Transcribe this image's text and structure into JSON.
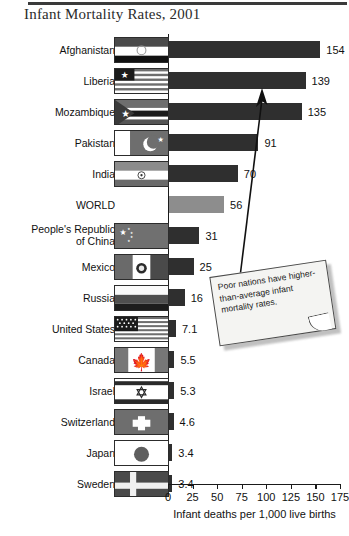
{
  "chart_data": {
    "type": "bar",
    "orientation": "horizontal",
    "title": "Infant Mortality Rates, 2001",
    "xlabel": "Infant deaths per 1,000 live births",
    "ylabel": "",
    "xlim": [
      0,
      175
    ],
    "xticks": [
      0,
      25,
      50,
      75,
      100,
      125,
      150,
      175
    ],
    "grid": false,
    "legend": false,
    "categories": [
      "Afghanistan",
      "Liberia",
      "Mozambique",
      "Pakistan",
      "India",
      "WORLD",
      "People's Republic of China",
      "Mexico",
      "Russia",
      "United States",
      "Canada",
      "Israel",
      "Switzerland",
      "Japan",
      "Sweden"
    ],
    "values": [
      154,
      139,
      135,
      91,
      70,
      56,
      31,
      25,
      16,
      7.1,
      5.5,
      5.3,
      4.6,
      3.4,
      3.4
    ],
    "value_labels": [
      "154",
      "139",
      "135",
      "91",
      "70",
      "56",
      "31",
      "25",
      "16",
      "7.1",
      "5.5",
      "5.3",
      "4.6",
      "3.4",
      "3.4"
    ],
    "highlight_category": "WORLD",
    "colors": {
      "bar": "#2f2f2f",
      "highlight_bar": "#8d8d8d",
      "axis": "#1a1a1a",
      "text": "#111111"
    },
    "annotation": {
      "text": "Poor nations have higher-than-average infant mortality rates.",
      "points_to": "Mozambique"
    }
  },
  "rows": [
    {
      "label": "Afghanistan",
      "label_lines": [
        "Afghanistan"
      ],
      "value": "154",
      "flag": "flag-afghanistan",
      "has_flag": true
    },
    {
      "label": "Liberia",
      "label_lines": [
        "Liberia"
      ],
      "value": "139",
      "flag": "flag-liberia",
      "has_flag": true
    },
    {
      "label": "Mozambique",
      "label_lines": [
        "Mozambique"
      ],
      "value": "135",
      "flag": "flag-mozambique",
      "has_flag": true
    },
    {
      "label": "Pakistan",
      "label_lines": [
        "Pakistan"
      ],
      "value": "91",
      "flag": "flag-pakistan",
      "has_flag": true
    },
    {
      "label": "India",
      "label_lines": [
        "India"
      ],
      "value": "70",
      "flag": "flag-india",
      "has_flag": true
    },
    {
      "label": "WORLD",
      "label_lines": [
        "WORLD"
      ],
      "value": "56",
      "flag": "",
      "has_flag": false
    },
    {
      "label": "People's Republic of China",
      "label_lines": [
        "People's Republic",
        "of China"
      ],
      "value": "31",
      "flag": "flag-china",
      "has_flag": true
    },
    {
      "label": "Mexico",
      "label_lines": [
        "Mexico"
      ],
      "value": "25",
      "flag": "flag-mexico",
      "has_flag": true
    },
    {
      "label": "Russia",
      "label_lines": [
        "Russia"
      ],
      "value": "16",
      "flag": "flag-russia",
      "has_flag": true
    },
    {
      "label": "United States",
      "label_lines": [
        "United States"
      ],
      "value": "7.1",
      "flag": "flag-usa",
      "has_flag": true
    },
    {
      "label": "Canada",
      "label_lines": [
        "Canada"
      ],
      "value": "5.5",
      "flag": "flag-canada",
      "has_flag": true
    },
    {
      "label": "Israel",
      "label_lines": [
        "Israel"
      ],
      "value": "5.3",
      "flag": "flag-israel",
      "has_flag": true
    },
    {
      "label": "Switzerland",
      "label_lines": [
        "Switzerland"
      ],
      "value": "4.6",
      "flag": "flag-switzerland",
      "has_flag": true
    },
    {
      "label": "Japan",
      "label_lines": [
        "Japan"
      ],
      "value": "3.4",
      "flag": "flag-japan",
      "has_flag": true
    },
    {
      "label": "Sweden",
      "label_lines": [
        "Sweden"
      ],
      "value": "3.4",
      "flag": "flag-sweden",
      "has_flag": true
    }
  ],
  "axis": {
    "tick_labels": [
      "0",
      "25",
      "50",
      "75",
      "100",
      "125",
      "150",
      "175"
    ],
    "title": "Infant deaths per 1,000 live births"
  },
  "callout": {
    "text": "Poor nations have higher-than-average infant mortality rates."
  }
}
